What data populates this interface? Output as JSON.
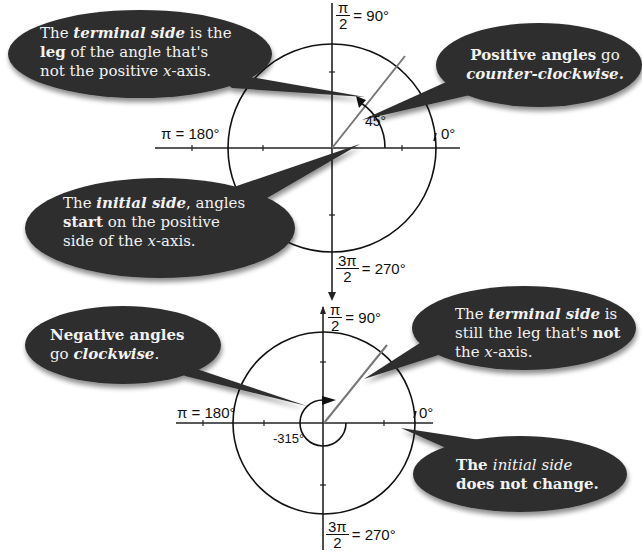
{
  "diagram": {
    "top_figure": {
      "angle_label": "45°",
      "axis_labels": {
        "top": {
          "num": "π",
          "den": "2",
          "value": "= 90°"
        },
        "left": "π = 180°",
        "right": "0°",
        "bottom": {
          "num": "3π",
          "den": "2",
          "value": "= 270°"
        }
      },
      "callouts": [
        {
          "id": "terminal",
          "parts": [
            {
              "t": "The ",
              "s": "n"
            },
            {
              "t": "terminal side",
              "s": "bi"
            },
            {
              "t": " is the",
              "s": "n"
            },
            {
              "t": "\n",
              "s": "br"
            },
            {
              "t": "leg",
              "s": "b"
            },
            {
              "t": " of the angle that's",
              "s": "n"
            },
            {
              "t": "\n",
              "s": "br"
            },
            {
              "t": "not the positive ",
              "s": "n"
            },
            {
              "t": "x",
              "s": "i"
            },
            {
              "t": "-axis.",
              "s": "n"
            }
          ]
        },
        {
          "id": "positive",
          "parts": [
            {
              "t": "Positive angles",
              "s": "b"
            },
            {
              "t": " go",
              "s": "n"
            },
            {
              "t": "\n",
              "s": "br"
            },
            {
              "t": "counter-clockwise.",
              "s": "bi"
            }
          ]
        },
        {
          "id": "initial",
          "parts": [
            {
              "t": "The ",
              "s": "n"
            },
            {
              "t": "initial side",
              "s": "bi"
            },
            {
              "t": ", angles",
              "s": "n"
            },
            {
              "t": "\n",
              "s": "br"
            },
            {
              "t": "start",
              "s": "b"
            },
            {
              "t": " on the positive",
              "s": "n"
            },
            {
              "t": "\n",
              "s": "br"
            },
            {
              "t": "side of the ",
              "s": "n"
            },
            {
              "t": "x",
              "s": "i"
            },
            {
              "t": "-axis.",
              "s": "n"
            }
          ]
        }
      ]
    },
    "bottom_figure": {
      "angle_label": "-315°",
      "axis_labels": {
        "top": {
          "num": "π",
          "den": "2",
          "value": "= 90°"
        },
        "left": "π = 180°",
        "right": "0°",
        "bottom": {
          "num": "3π",
          "den": "2",
          "value": "= 270°"
        }
      },
      "callouts": [
        {
          "id": "negative",
          "parts": [
            {
              "t": "Negative angles",
              "s": "b"
            },
            {
              "t": "\n",
              "s": "br"
            },
            {
              "t": "go ",
              "s": "n"
            },
            {
              "t": "clockwise",
              "s": "bi"
            },
            {
              "t": ".",
              "s": "n"
            }
          ]
        },
        {
          "id": "terminal2",
          "parts": [
            {
              "t": "The ",
              "s": "n"
            },
            {
              "t": "terminal side",
              "s": "bi"
            },
            {
              "t": " is",
              "s": "n"
            },
            {
              "t": "\n",
              "s": "br"
            },
            {
              "t": "still the leg that's ",
              "s": "n"
            },
            {
              "t": "not",
              "s": "b"
            },
            {
              "t": "\n",
              "s": "br"
            },
            {
              "t": "the ",
              "s": "n"
            },
            {
              "t": "x",
              "s": "i"
            },
            {
              "t": "-axis.",
              "s": "n"
            }
          ]
        },
        {
          "id": "initial2",
          "parts": [
            {
              "t": "The ",
              "s": "b"
            },
            {
              "t": "initial side",
              "s": "i"
            },
            {
              "t": "\n",
              "s": "br"
            },
            {
              "t": "does not change.",
              "s": "b"
            }
          ]
        }
      ]
    },
    "colors": {
      "bubble": "#2e2e2e",
      "bubble_text": "#f2f2f2",
      "axis": "#222222",
      "terminal_ray": "#777777"
    }
  }
}
